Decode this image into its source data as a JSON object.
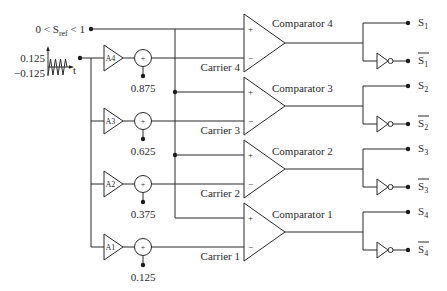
{
  "colors": {
    "line": "#2b2b2b",
    "background": "#ffffff"
  },
  "reference_input": {
    "prefix": "0 < S",
    "subscript": "ref",
    "suffix": " < 1"
  },
  "carrier_source": {
    "upper_value": "0.125",
    "lower_value": "−0.125",
    "time_axis_label": "t",
    "waveform_icon": "triangle-wave-icon"
  },
  "stages": [
    {
      "amplifier_label": "A4",
      "sum_sign": "+",
      "offset_value": "0.875",
      "carrier_label": "Carrier 4",
      "comparator_label": "Comparator 4",
      "plus_sign": "+",
      "minus_sign": "−",
      "output": {
        "name": "S",
        "index": "1"
      },
      "output_inverted": {
        "name": "S",
        "index": "1"
      }
    },
    {
      "amplifier_label": "A3",
      "sum_sign": "+",
      "offset_value": "0.625",
      "carrier_label": "Carrier 3",
      "comparator_label": "Comparator 3",
      "plus_sign": "+",
      "minus_sign": "−",
      "output": {
        "name": "S",
        "index": "2"
      },
      "output_inverted": {
        "name": "S",
        "index": "2"
      }
    },
    {
      "amplifier_label": "A2",
      "sum_sign": "+",
      "offset_value": "0.375",
      "carrier_label": "Carrier 2",
      "comparator_label": "Comparator 2",
      "plus_sign": "+",
      "minus_sign": "−",
      "output": {
        "name": "S",
        "index": "3"
      },
      "output_inverted": {
        "name": "S",
        "index": "3"
      }
    },
    {
      "amplifier_label": "A1",
      "sum_sign": "+",
      "offset_value": "0.125",
      "carrier_label": "Carrier 1",
      "comparator_label": "Comparator 1",
      "plus_sign": "+",
      "minus_sign": "−",
      "output": {
        "name": "S",
        "index": "4"
      },
      "output_inverted": {
        "name": "S",
        "index": "4"
      }
    }
  ]
}
